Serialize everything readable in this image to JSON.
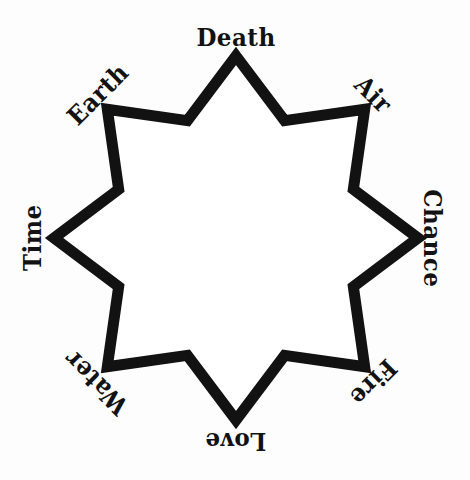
{
  "page": {
    "background_color": "#fdfdfd",
    "width": 470,
    "height": 480
  },
  "figure": {
    "name": "octagram",
    "stroke_color": "#121212",
    "fill_color": "#ffffff",
    "stroke_width": 11,
    "center": {
      "x": 236,
      "y": 238
    },
    "outer_radius": 182,
    "inner_radius": 127,
    "point_count": 8
  },
  "labels": {
    "font_color": "#121212",
    "style": "blackletter",
    "items": [
      {
        "text": "Death",
        "angle_deg": 0,
        "rotation_deg": 0,
        "x": 236,
        "y": 38,
        "position": "top"
      },
      {
        "text": "Air",
        "angle_deg": 45,
        "rotation_deg": 45,
        "x": 373,
        "y": 95,
        "position": "top-right"
      },
      {
        "text": "Chance",
        "angle_deg": 90,
        "rotation_deg": 90,
        "x": 432,
        "y": 238,
        "position": "right"
      },
      {
        "text": "Fire",
        "angle_deg": 135,
        "rotation_deg": 135,
        "x": 373,
        "y": 382,
        "position": "bottom-right"
      },
      {
        "text": "Love",
        "angle_deg": 180,
        "rotation_deg": 180,
        "x": 236,
        "y": 441,
        "position": "bottom"
      },
      {
        "text": "Water",
        "angle_deg": 225,
        "rotation_deg": 225,
        "x": 96,
        "y": 382,
        "position": "bottom-left"
      },
      {
        "text": "Time",
        "angle_deg": 270,
        "rotation_deg": 270,
        "x": 33,
        "y": 238,
        "position": "left"
      },
      {
        "text": "Earth",
        "angle_deg": 315,
        "rotation_deg": 315,
        "x": 98,
        "y": 95,
        "position": "top-left"
      }
    ]
  }
}
